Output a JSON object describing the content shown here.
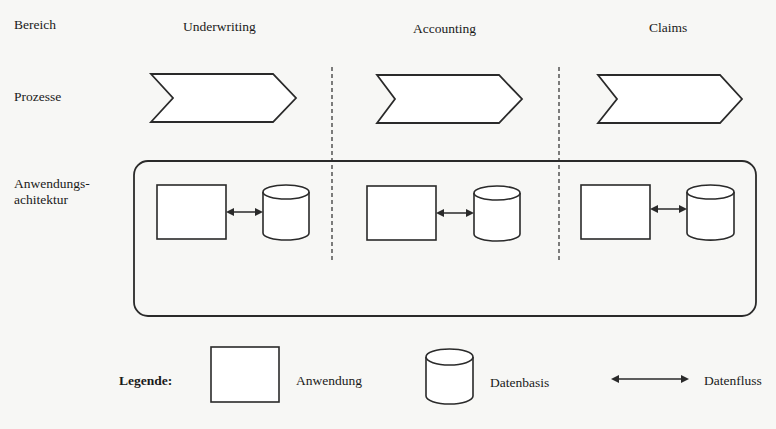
{
  "row_labels": {
    "bereich": "Bereich",
    "prozesse": "Prozesse",
    "anwendung_line1": "Anwendungs-",
    "anwendung_line2": "achitektur"
  },
  "columns": [
    {
      "title": "Underwriting"
    },
    {
      "title": "Accounting"
    },
    {
      "title": "Claims"
    }
  ],
  "legend": {
    "title": "Legende:",
    "items": [
      {
        "icon": "application-rectangle-icon",
        "label": "Anwendung"
      },
      {
        "icon": "database-cylinder-icon",
        "label": "Datenbasis"
      },
      {
        "icon": "double-arrow-icon",
        "label": "Datenfluss"
      }
    ]
  },
  "colors": {
    "stroke": "#2a2a2a",
    "background": "#f7f7f5",
    "fill": "#ffffff"
  }
}
